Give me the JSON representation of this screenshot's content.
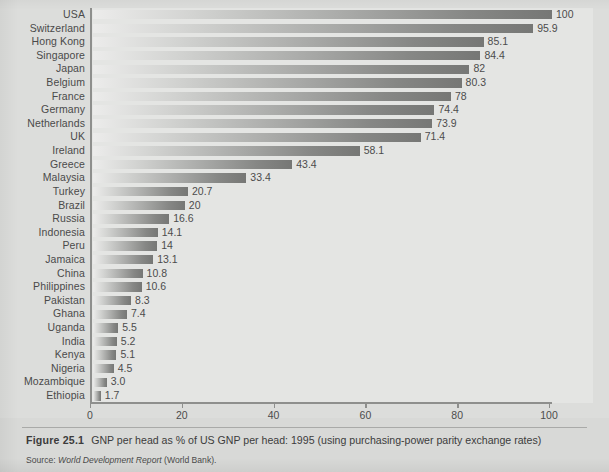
{
  "figure": {
    "number_label": "Figure 25.1",
    "caption": "GNP per head as % of US GNP per head: 1995 (using purchasing-power parity exchange rates)",
    "source_prefix": "Source: ",
    "source_title": "World Development Report",
    "source_suffix": " (World Bank)."
  },
  "axis": {
    "x_ticks": [
      "0",
      "20",
      "40",
      "60",
      "80",
      "100"
    ],
    "x_min": 0,
    "x_max": 100
  },
  "chart_data": {
    "type": "bar",
    "orientation": "horizontal",
    "title": "GNP per head as % of US GNP per head: 1995 (using purchasing-power parity exchange rates)",
    "xlabel": "",
    "ylabel": "",
    "xlim": [
      0,
      100
    ],
    "xticks": [
      0,
      20,
      40,
      60,
      80,
      100
    ],
    "grid": false,
    "legend": false,
    "categories": [
      "USA",
      "Switzerland",
      "Hong Kong",
      "Singapore",
      "Japan",
      "Belgium",
      "France",
      "Germany",
      "Netherlands",
      "UK",
      "Ireland",
      "Greece",
      "Malaysia",
      "Turkey",
      "Brazil",
      "Russia",
      "Indonesia",
      "Peru",
      "Jamaica",
      "China",
      "Philippines",
      "Pakistan",
      "Ghana",
      "Uganda",
      "India",
      "Kenya",
      "Nigeria",
      "Mozambique",
      "Ethiopia"
    ],
    "values": [
      100,
      95.9,
      85.1,
      84.4,
      82,
      80.3,
      78,
      74.4,
      73.9,
      71.4,
      58.1,
      43.4,
      33.4,
      20.7,
      20,
      16.6,
      14.1,
      14,
      13.1,
      10.8,
      10.6,
      8.3,
      7.4,
      5.5,
      5.2,
      5.1,
      4.5,
      3.0,
      1.7
    ],
    "value_labels": [
      "100",
      "95.9",
      "85.1",
      "84.4",
      "82",
      "80.3",
      "78",
      "74.4",
      "73.9",
      "71.4",
      "58.1",
      "43.4",
      "33.4",
      "20.7",
      "20",
      "16.6",
      "14.1",
      "14",
      "13.1",
      "10.8",
      "10.6",
      "8.3",
      "7.4",
      "5.5",
      "5.2",
      "5.1",
      "4.5",
      "3.0",
      "1.7"
    ]
  },
  "colors": {
    "page_background": "#d8d9d7",
    "plot_background": "#e4e5e3",
    "axis": "#8e8f8d",
    "bar_light": "#ececeb",
    "bar_dark": "#767775",
    "text": "#3c3c3c"
  }
}
